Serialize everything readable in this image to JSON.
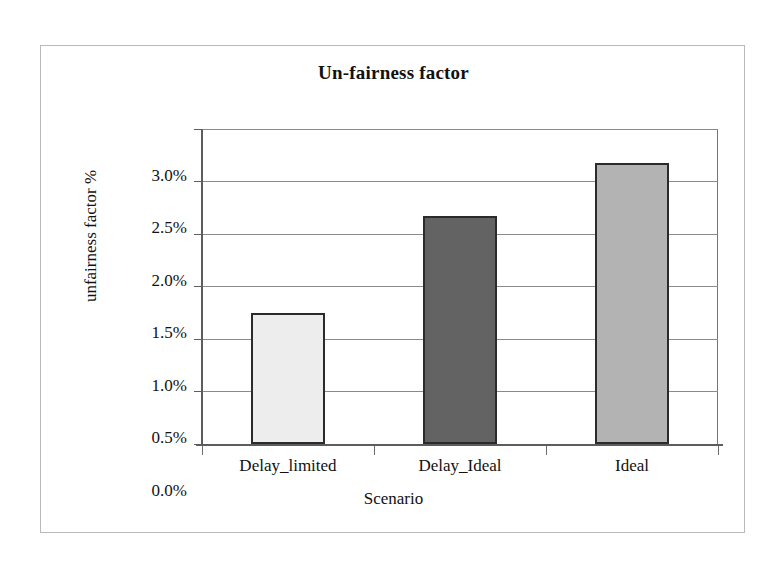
{
  "chart_data": {
    "type": "bar",
    "title": "Un-fairness factor",
    "xlabel": "Scenario",
    "ylabel": "unfairness factor %",
    "categories": [
      "Delay_limited",
      "Delay_Ideal",
      "Ideal"
    ],
    "values": [
      1.25,
      2.17,
      2.68
    ],
    "value_labels": [
      "1.25%",
      "2.17%",
      "2.68%"
    ],
    "ylim": [
      0,
      3.0
    ],
    "ytick_values": [
      0.0,
      0.5,
      1.0,
      1.5,
      2.0,
      2.5,
      3.0
    ],
    "ytick_labels": [
      "0.0%",
      "0.5%",
      "1.0%",
      "1.5%",
      "2.0%",
      "2.5%",
      "3.0%"
    ],
    "grid": true,
    "legend": false,
    "series": [
      {
        "name": "unfairness factor %",
        "values": [
          1.25,
          2.17,
          2.68
        ],
        "bar_colors": [
          "#ededed",
          "#636363",
          "#b3b3b3"
        ],
        "bar_edge_color": "#2b2b2b"
      }
    ]
  },
  "figure": {
    "frame_color": "#b9b9b9",
    "axis_color": "#5d5d5d",
    "grid_color": "#8a8a8a",
    "background": "#ffffff"
  }
}
